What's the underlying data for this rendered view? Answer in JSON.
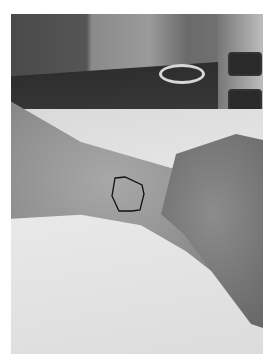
{
  "image": {
    "description": "Grayscale clinical photograph of a forearm and wrist resting on white examination paper, with a hand-drawn polygon outline marking a region on the wrist",
    "annotation": {
      "shape": "polygon-outline",
      "color": "#111111",
      "points": "104,164 114,163 131,171 133,180 129,196 121,197 108,197 101,182"
    },
    "colors": {
      "background_border": "#ffffff",
      "sheet": "#e0e0e0",
      "skin": "#9a9a9a"
    }
  }
}
